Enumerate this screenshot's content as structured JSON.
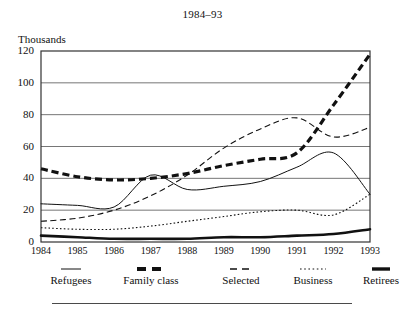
{
  "chart_data": {
    "type": "line",
    "title": "1984–93",
    "xlabel": "",
    "ylabel": "Thousands",
    "ylim": [
      0,
      120
    ],
    "yticks": [
      0,
      20,
      40,
      60,
      80,
      100,
      120
    ],
    "grid": true,
    "legend_position": "bottom",
    "categories": [
      "1984",
      "1985",
      "1986",
      "1987",
      "1988",
      "1989",
      "1990",
      "1991",
      "1992",
      "1993"
    ],
    "x": [
      1984,
      1985,
      1986,
      1987,
      1988,
      1989,
      1990,
      1991,
      1992,
      1993
    ],
    "series": [
      {
        "name": "Refugees",
        "style": "thin-solid",
        "values": [
          24,
          23,
          22,
          42,
          33,
          35,
          38,
          47,
          56,
          30
        ]
      },
      {
        "name": "Family class",
        "style": "thick-dashed",
        "values": [
          46,
          41,
          39,
          40,
          43,
          48,
          52,
          56,
          86,
          118
        ]
      },
      {
        "name": "Selected",
        "style": "medium-dashed",
        "values": [
          13,
          15,
          20,
          29,
          42,
          59,
          71,
          78,
          66,
          72
        ]
      },
      {
        "name": "Business",
        "style": "dotted",
        "values": [
          9,
          8,
          8,
          10,
          13,
          16,
          19,
          20,
          17,
          30
        ]
      },
      {
        "name": "Retirees",
        "style": "thick-solid",
        "values": [
          4,
          3,
          2,
          2,
          2,
          3,
          3,
          4,
          5,
          8
        ]
      }
    ]
  },
  "legend": {
    "items": [
      {
        "label": "Refugees",
        "swatch": "thin-solid-swatch"
      },
      {
        "label": "Family class",
        "swatch": "thick-dashed-swatch"
      },
      {
        "label": "Selected",
        "swatch": "medium-dashed-swatch"
      },
      {
        "label": "Business",
        "swatch": "dotted-swatch"
      },
      {
        "label": "Retirees",
        "swatch": "thick-solid-swatch"
      }
    ]
  },
  "colors": {
    "ink": "#111111",
    "grid": "#666666",
    "frame": "#333333",
    "background": "#ffffff"
  }
}
